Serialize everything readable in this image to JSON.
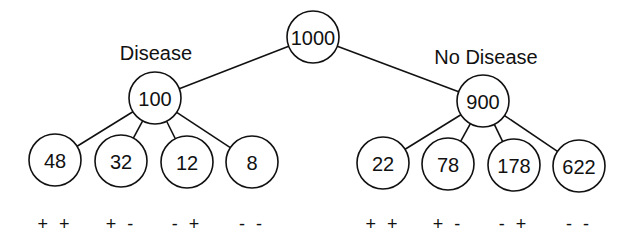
{
  "diagram": {
    "type": "tree",
    "root": {
      "id": "root",
      "label": "1000",
      "x": 313,
      "y": 37
    },
    "groups": [
      {
        "id": "disease",
        "title": "Disease",
        "title_pos": {
          "x": 156,
          "y": 60
        },
        "node": {
          "label": "100",
          "x": 155,
          "y": 98
        },
        "leaves": [
          {
            "label": "48",
            "x": 55,
            "y": 160,
            "sign": "+ +"
          },
          {
            "label": "32",
            "x": 121,
            "y": 161,
            "sign": "+ -"
          },
          {
            "label": "12",
            "x": 187,
            "y": 162,
            "sign": "- +"
          },
          {
            "label": "8",
            "x": 252,
            "y": 162,
            "sign": "- -"
          }
        ]
      },
      {
        "id": "no-disease",
        "title": "No Disease",
        "title_pos": {
          "x": 486,
          "y": 64
        },
        "node": {
          "label": "900",
          "x": 483,
          "y": 101
        },
        "leaves": [
          {
            "label": "22",
            "x": 383,
            "y": 163,
            "sign": "+ +"
          },
          {
            "label": "78",
            "x": 448,
            "y": 164,
            "sign": "+ -"
          },
          {
            "label": "178",
            "x": 514,
            "y": 165,
            "sign": "- +"
          },
          {
            "label": "622",
            "x": 579,
            "y": 166,
            "sign": "- -"
          }
        ]
      }
    ],
    "node_radius": 26,
    "sign_row_y": 230
  }
}
